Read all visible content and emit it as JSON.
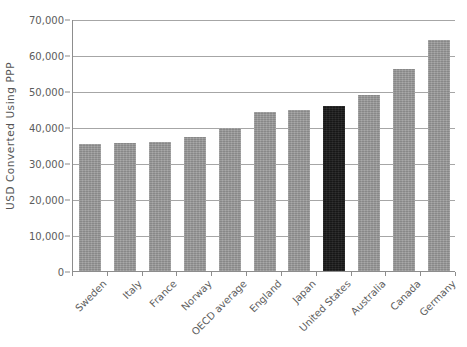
{
  "chart_data": {
    "type": "bar",
    "title": "",
    "xlabel": "",
    "ylabel": "USD Converted Using PPP",
    "ylim": [
      0,
      70000
    ],
    "ytick_step": 10000,
    "grid": true,
    "legend": "none",
    "categories": [
      "Sweden",
      "Italy",
      "France",
      "Norway",
      "OECD average",
      "England",
      "Japan",
      "United States",
      "Australia",
      "Canada",
      "Germany"
    ],
    "values": [
      35200,
      35600,
      35800,
      37300,
      39800,
      44200,
      44800,
      45700,
      48800,
      56100,
      64200
    ],
    "ytick_labels": [
      "70,000",
      "60,000",
      "50,000",
      "40,000",
      "30,000",
      "20,000",
      "10,000",
      "0"
    ],
    "ytick_values": [
      70000,
      60000,
      50000,
      40000,
      30000,
      20000,
      10000,
      0
    ],
    "highlight_category": "United States",
    "colors": {
      "bar": "#989898",
      "bar_highlight": "#1c1c1c",
      "gridline": "#a6a6a6",
      "axis": "#8d8d8d",
      "text": "#5a5a5a",
      "background": "#ffffff"
    }
  }
}
